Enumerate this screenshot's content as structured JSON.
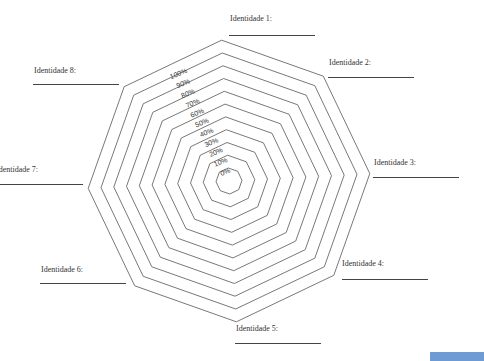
{
  "chart_data": {
    "type": "radar",
    "title": "",
    "axes": [
      "Identidade 1:",
      "Identidade 2:",
      "Identidade 3:",
      "Identidade 4:",
      "Identidade 5:",
      "Identidade 6:",
      "Identidade 7:",
      "Identidade 8:"
    ],
    "ring_labels": [
      "0%",
      "10%",
      "20%",
      "30%",
      "40%",
      "50%",
      "60%",
      "70%",
      "80%",
      "90%",
      "100%"
    ],
    "range": [
      0,
      100
    ],
    "series": [],
    "grid": true,
    "legend": "none"
  },
  "labels": {
    "axis1": "Identidade 1:",
    "axis2": "Identidade 2:",
    "axis3": "Identidade 3:",
    "axis4": "Identidade 4:",
    "axis5": "Identidade 5:",
    "axis6": "Identidade 6:",
    "axis7": "Identidade 7:",
    "axis8": "Identidade 8:"
  },
  "colors": {
    "grid": "#555555",
    "text": "#333333",
    "corner_bar": "#6f9bd4"
  }
}
